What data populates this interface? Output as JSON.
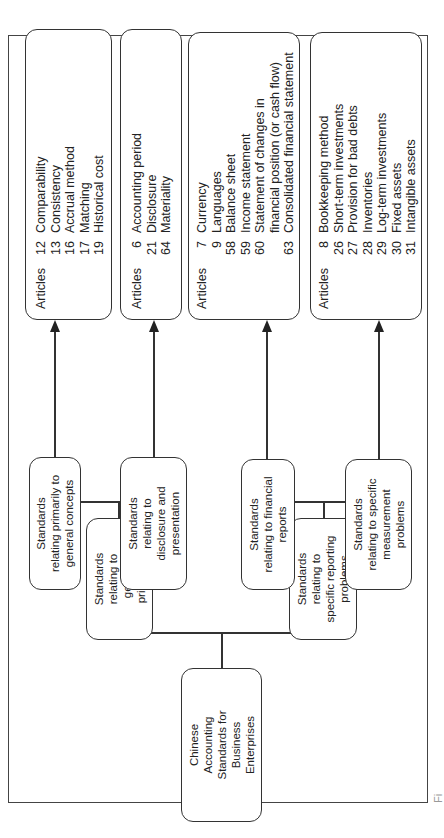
{
  "diagram": {
    "root": {
      "label": "Chinese\nAccounting\nStandards for\nBusiness\nEnterprises"
    },
    "level1": [
      {
        "label": "Standards\nrelating to\ngeneral\nprinciples"
      },
      {
        "label": "Standards\nrelating to\nspecific reporting\nproblems"
      }
    ],
    "level2": [
      {
        "label": "Standards\nrelating primarily to\ngeneral concepts"
      },
      {
        "label": "Standards\nrelating to\ndisclosure and\npresentation"
      },
      {
        "label": "Standards\nrelating to financial\nreports"
      },
      {
        "label": "Standards\nrelating to specific\nmeasurement\nproblems"
      }
    ],
    "articles_label": "Articles",
    "article_groups": [
      {
        "items": [
          {
            "num": "12",
            "text": "Comparability"
          },
          {
            "num": "13",
            "text": "Consistency"
          },
          {
            "num": "16",
            "text": "Accrual method"
          },
          {
            "num": "17",
            "text": "Matching"
          },
          {
            "num": "19",
            "text": "Historical cost"
          }
        ]
      },
      {
        "items": [
          {
            "num": "6",
            "text": "Accounting period"
          },
          {
            "num": "21",
            "text": "Disclosure"
          },
          {
            "num": "64",
            "text": "Materiality"
          }
        ]
      },
      {
        "items": [
          {
            "num": "7",
            "text": "Currency"
          },
          {
            "num": "9",
            "text": "Languages"
          },
          {
            "num": "58",
            "text": "Balance sheet"
          },
          {
            "num": "59",
            "text": "Income statement"
          },
          {
            "num": "60",
            "text": "Statement of changes in"
          },
          {
            "num": "",
            "text": "financial position (or cash flow)"
          },
          {
            "num": "63",
            "text": "Consolidated financial statement"
          }
        ]
      },
      {
        "items": [
          {
            "num": "8",
            "text": "Bookkeeping method"
          },
          {
            "num": "26",
            "text": "Short-term investments"
          },
          {
            "num": "27",
            "text": "Provision for bad debts"
          },
          {
            "num": "28",
            "text": "Inventories"
          },
          {
            "num": "29",
            "text": "Log-term investments"
          },
          {
            "num": "30",
            "text": "Fixed assets"
          },
          {
            "num": "31",
            "text": "Intangible assets"
          }
        ]
      }
    ],
    "caption": "Fi"
  },
  "colors": {
    "line": "#333333",
    "background": "#ffffff",
    "text": "#222222"
  }
}
